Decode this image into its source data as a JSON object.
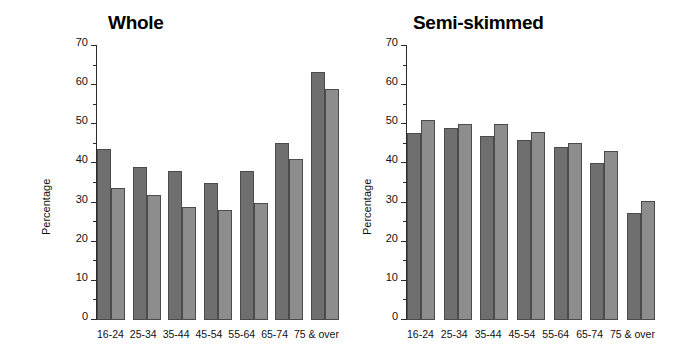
{
  "chart_data": [
    {
      "type": "bar",
      "title": "Whole",
      "xlabel": "",
      "ylabel": "Percentage",
      "ylim": [
        0,
        70
      ],
      "yticks": [
        0,
        10,
        20,
        30,
        40,
        50,
        60,
        70
      ],
      "ytick_minor_step": 5,
      "grid": false,
      "legend": null,
      "categories": [
        "16-24",
        "25-34",
        "35-44",
        "45-54",
        "55-64",
        "65-74",
        "75 & over"
      ],
      "series": [
        {
          "name": "series-1",
          "color": "#6f6f6f",
          "values": [
            43.7,
            39.0,
            38.0,
            35.1,
            38.0,
            45.2,
            63.3
          ]
        },
        {
          "name": "series-2",
          "color": "#8d8d8d",
          "values": [
            33.8,
            32.0,
            29.0,
            28.0,
            30.0,
            41.1,
            59.1
          ]
        }
      ]
    },
    {
      "type": "bar",
      "title": "Semi-skimmed",
      "xlabel": "",
      "ylabel": "Percentage",
      "ylim": [
        0,
        70
      ],
      "yticks": [
        0,
        10,
        20,
        30,
        40,
        50,
        60,
        70
      ],
      "ytick_minor_step": 5,
      "grid": false,
      "legend": null,
      "categories": [
        "16-24",
        "25-34",
        "35-44",
        "45-54",
        "55-64",
        "65-74",
        "75 & over"
      ],
      "series": [
        {
          "name": "series-1",
          "color": "#6f6f6f",
          "values": [
            47.9,
            49.0,
            47.1,
            46.0,
            44.1,
            40.2,
            27.3
          ]
        },
        {
          "name": "series-2",
          "color": "#8d8d8d",
          "values": [
            51.0,
            50.1,
            50.1,
            48.0,
            45.1,
            43.1,
            30.3
          ]
        }
      ]
    }
  ],
  "colors": {
    "series_1": "#6f6f6f",
    "series_2": "#8d8d8d",
    "axis": "#2a2a2a",
    "text": "#111111",
    "background": "#ffffff"
  }
}
